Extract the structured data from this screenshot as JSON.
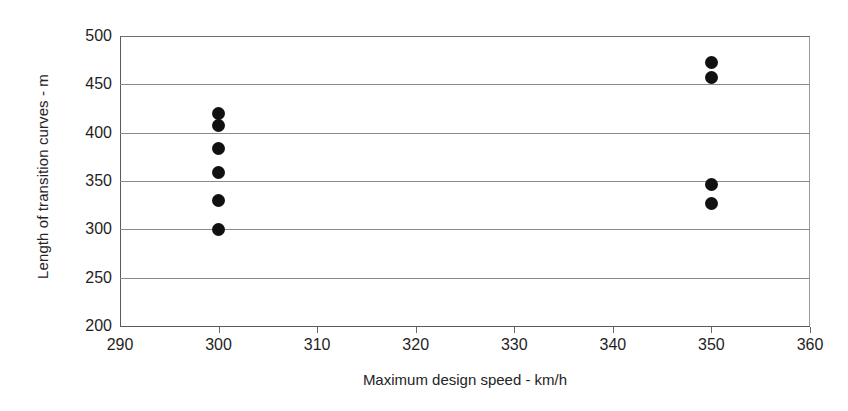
{
  "chart_data": {
    "type": "scatter",
    "title": "",
    "xlabel": "Maximum design speed - km/h",
    "ylabel": "Length of transition curves - m",
    "xlim": [
      290,
      360
    ],
    "ylim": [
      200,
      500
    ],
    "xticks": [
      290,
      300,
      310,
      320,
      330,
      340,
      350,
      360
    ],
    "xticklabels": [
      "290",
      "300",
      "310",
      "320",
      "330",
      "340",
      "350",
      "360"
    ],
    "yticks": [
      200,
      250,
      300,
      350,
      400,
      450,
      500
    ],
    "yticklabels": [
      "200",
      "250",
      "300",
      "350",
      "400",
      "450",
      "500"
    ],
    "grid": "horizontal",
    "legend": "none",
    "marker": "filled-circle",
    "marker_color": "#111111",
    "points": [
      {
        "x": 300,
        "y": 420
      },
      {
        "x": 300,
        "y": 407
      },
      {
        "x": 300,
        "y": 384
      },
      {
        "x": 300,
        "y": 359
      },
      {
        "x": 300,
        "y": 330
      },
      {
        "x": 300,
        "y": 300
      },
      {
        "x": 350,
        "y": 473
      },
      {
        "x": 350,
        "y": 457
      },
      {
        "x": 350,
        "y": 346
      },
      {
        "x": 350,
        "y": 327
      }
    ]
  },
  "colors": {
    "grid": "#8a8a8a",
    "axis": "#5a5a5a",
    "marker": "#111111",
    "text": "#1f1f1f",
    "background": "#ffffff"
  }
}
